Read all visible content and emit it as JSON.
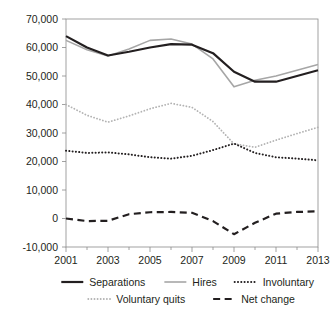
{
  "chart_data": {
    "type": "line",
    "title": "",
    "subtitle": "",
    "xlabel": "",
    "ylabel": "",
    "x": [
      2001,
      2002,
      2003,
      2004,
      2005,
      2006,
      2007,
      2008,
      2009,
      2010,
      2011,
      2012,
      2013
    ],
    "xlim": [
      2001,
      2013
    ],
    "ylim": [
      -10000,
      70000
    ],
    "grid": false,
    "legend_position": "bottom",
    "xtick_labels": [
      "2001",
      "2003",
      "2005",
      "2007",
      "2009",
      "2011",
      "2013"
    ],
    "xtick_values": [
      2001,
      2003,
      2005,
      2007,
      2009,
      2011,
      2013
    ],
    "minor_xtick_values": [
      2002,
      2004,
      2006,
      2008,
      2010,
      2012
    ],
    "ytick_labels": [
      "70,000",
      "60,000",
      "50,000",
      "40,000",
      "30,000",
      "20,000",
      "10,000",
      "0",
      "-10,000"
    ],
    "ytick_values": [
      70000,
      60000,
      50000,
      40000,
      30000,
      20000,
      10000,
      0,
      -10000
    ],
    "series": [
      {
        "name": "Separations",
        "style": "solid",
        "color": "#231f20",
        "width": 2.2,
        "values": [
          64000,
          60000,
          57200,
          58500,
          60000,
          61200,
          61000,
          58000,
          51500,
          48000,
          48000,
          50000,
          52000
        ]
      },
      {
        "name": "Hires",
        "style": "solid",
        "color": "#a6a6a6",
        "width": 1.6,
        "values": [
          62500,
          59200,
          57000,
          59500,
          62500,
          63000,
          61200,
          56000,
          46200,
          48500,
          50000,
          52000,
          54000
        ]
      },
      {
        "name": "Involuntary",
        "style": "dotted-thick",
        "color": "#231f20",
        "width": 2.0,
        "values": [
          23800,
          23000,
          23200,
          22500,
          21500,
          21000,
          22000,
          24000,
          26300,
          23000,
          21500,
          21000,
          20400
        ]
      },
      {
        "name": "Voluntary quits",
        "style": "dotted-thin",
        "color": "#b3b3b3",
        "width": 1.8,
        "values": [
          40000,
          36200,
          33800,
          36000,
          38500,
          40400,
          39000,
          34000,
          26200,
          25000,
          27500,
          29800,
          32000
        ]
      },
      {
        "name": "Net change",
        "style": "dashed",
        "color": "#231f20",
        "width": 2.2,
        "values": [
          0,
          -900,
          -800,
          1500,
          2200,
          2300,
          2000,
          -900,
          -5500,
          -1500,
          1700,
          2300,
          2500
        ]
      }
    ]
  },
  "legend": {
    "rows": [
      [
        "Separations",
        "Hires",
        "Involuntary"
      ],
      [
        "Voluntary quits",
        "Net change"
      ]
    ],
    "entries": [
      {
        "label": "Separations",
        "series": "Separations"
      },
      {
        "label": "Hires",
        "series": "Hires"
      },
      {
        "label": "Involuntary",
        "series": "Involuntary"
      },
      {
        "label": "Voluntary quits",
        "series": "Voluntary quits"
      },
      {
        "label": "Net change",
        "series": "Net change"
      }
    ]
  },
  "axes": {
    "axis_color": "#8a8a8a",
    "text_color": "#231f20",
    "background": "#ffffff"
  }
}
